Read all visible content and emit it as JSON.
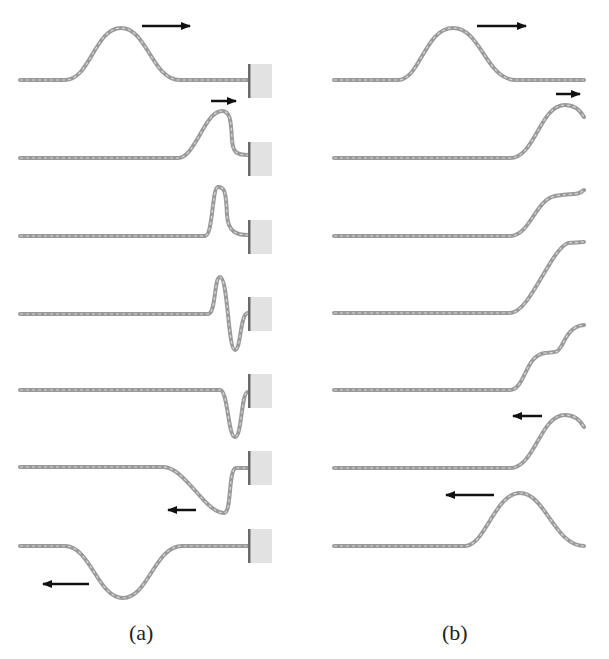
{
  "figure": {
    "panels": [
      {
        "id": "a",
        "caption": "(a)",
        "end_condition": "fixed end (wall)",
        "frames": [
          {
            "step": 1,
            "description": "upright pulse travelling right",
            "arrow": "right"
          },
          {
            "step": 2,
            "description": "pulse reaching wall",
            "arrow": "right"
          },
          {
            "step": 3,
            "description": "pulse at wall, narrow upward peak",
            "arrow": null
          },
          {
            "step": 4,
            "description": "pulse inverting at wall",
            "arrow": null
          },
          {
            "step": 5,
            "description": "inverted pulse at wall",
            "arrow": null
          },
          {
            "step": 6,
            "description": "inverted pulse leaving wall",
            "arrow": "left"
          },
          {
            "step": 7,
            "description": "inverted pulse travelling left",
            "arrow": "left"
          }
        ]
      },
      {
        "id": "b",
        "caption": "(b)",
        "end_condition": "free end",
        "frames": [
          {
            "step": 1,
            "description": "upright pulse travelling right",
            "arrow": "right"
          },
          {
            "step": 2,
            "description": "pulse reaching free end",
            "arrow": "right"
          },
          {
            "step": 3,
            "description": "pulse at free end",
            "arrow": null
          },
          {
            "step": 4,
            "description": "free end at maximum displacement",
            "arrow": null
          },
          {
            "step": 5,
            "description": "pulse reflecting",
            "arrow": null
          },
          {
            "step": 6,
            "description": "upright pulse leaving end",
            "arrow": "left"
          },
          {
            "step": 7,
            "description": "upright pulse travelling left",
            "arrow": "left"
          }
        ]
      }
    ]
  },
  "colors": {
    "string": "#9a9a9a",
    "string_dots": "#d8d8d8",
    "wall_fill": "#e2e2e2",
    "wall_edge": "#6a6a6a",
    "arrow": "#111111"
  }
}
